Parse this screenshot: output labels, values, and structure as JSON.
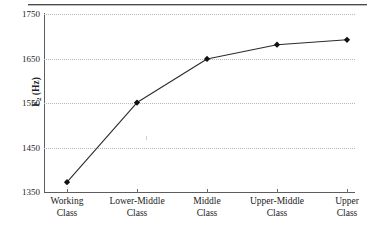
{
  "figure": {
    "has_top_rule": true,
    "background_color": "#ffffff",
    "line_color": "#2b2b2b",
    "marker_color": "#111111",
    "grid_color": "#b9b9b9",
    "axis_color": "#5d5d5d"
  },
  "chart_data": {
    "type": "line",
    "title": "",
    "xlabel": "",
    "ylabel": "F2 (Hz)",
    "ylabel_plain": "F2 (Hz)",
    "categories": [
      "Working Class",
      "Lower-Middle Class",
      "Middle Class",
      "Upper-Middle Class",
      "Upper Class"
    ],
    "category_lines": [
      [
        "Working",
        "Class"
      ],
      [
        "Lower-Middle",
        "Class"
      ],
      [
        "Middle",
        "Class"
      ],
      [
        "Upper-Middle",
        "Class"
      ],
      [
        "Upper",
        "Class"
      ]
    ],
    "values": [
      1372,
      1551,
      1649,
      1681,
      1692
    ],
    "ylim": [
      1350,
      1750
    ],
    "yticks": [
      1350,
      1450,
      1550,
      1650,
      1750
    ],
    "ytick_labels": [
      "1350",
      "1450",
      "1550",
      "1650",
      "1750"
    ],
    "grid": "horizontal-dotted",
    "legend": "none",
    "marker": "filled-diamond",
    "series": [
      {
        "name": "F2",
        "values": [
          1372,
          1551,
          1649,
          1681,
          1692
        ]
      }
    ]
  }
}
